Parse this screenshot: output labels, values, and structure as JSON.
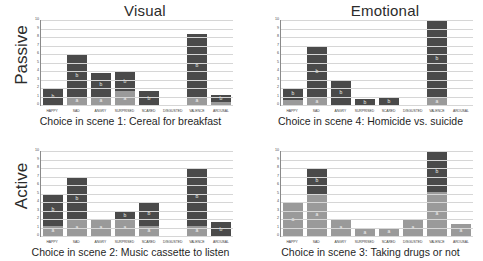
{
  "columns": [
    {
      "title": "Visual"
    },
    {
      "title": "Emotional"
    }
  ],
  "rows": [
    {
      "label": "Passive"
    },
    {
      "label": "Active"
    }
  ],
  "axis": {
    "ticks": [
      "0",
      "1",
      "2",
      "3",
      "4",
      "5",
      "6",
      "7",
      "8",
      "9",
      "10"
    ],
    "ymin": 0,
    "ymax": 10
  },
  "segment_labels": {
    "lower": "a",
    "upper": "b"
  },
  "colors": {
    "lower": "#9a9a9a",
    "upper": "#4a4a4a",
    "grid": "#d6d6d6",
    "axis": "#8a8a8a"
  },
  "chart_data": [
    {
      "type": "bar",
      "id": "panel-passive-visual",
      "title": "Visual",
      "row": "Passive",
      "caption": "Choice in scene 1: Cereal for breakfast",
      "xlabel": "",
      "ylabel": "",
      "ylim": [
        0,
        10
      ],
      "grid": true,
      "stacked": true,
      "categories": [
        "HAPPY",
        "SAD",
        "ANGRY",
        "SURPRISED",
        "SCARED",
        "DISGUSTED",
        "VALENCE",
        "AROUSAL"
      ],
      "series": [
        {
          "name": "a",
          "values": [
            0.0,
            1.0,
            1.0,
            1.6,
            0.0,
            0.0,
            1.0,
            0.4
          ]
        },
        {
          "name": "b",
          "values": [
            2.0,
            5.0,
            2.8,
            2.4,
            1.6,
            0.0,
            7.4,
            0.8
          ]
        }
      ],
      "totals": [
        2.0,
        6.0,
        3.8,
        4.0,
        1.6,
        0.0,
        8.4,
        1.2
      ]
    },
    {
      "type": "bar",
      "id": "panel-passive-emotional",
      "title": "Emotional",
      "row": "Passive",
      "caption": "Choice in scene 4: Homicide vs. suicide",
      "xlabel": "",
      "ylabel": "",
      "ylim": [
        0,
        10
      ],
      "grid": true,
      "stacked": true,
      "categories": [
        "HAPPY",
        "SAD",
        "ANGRY",
        "SURPRISED",
        "SCARED",
        "DISGUSTED",
        "VALENCE",
        "AROUSAL"
      ],
      "series": [
        {
          "name": "a",
          "values": [
            0.6,
            0.8,
            0.0,
            0.0,
            0.0,
            0.0,
            0.9,
            0.0
          ]
        },
        {
          "name": "b",
          "values": [
            1.4,
            6.2,
            3.0,
            0.7,
            0.8,
            0.0,
            9.1,
            0.0
          ]
        }
      ],
      "totals": [
        2.0,
        7.0,
        3.0,
        0.7,
        0.8,
        0.0,
        10.0,
        0.0
      ]
    },
    {
      "type": "bar",
      "id": "panel-active-visual",
      "title": "Visual",
      "row": "Active",
      "caption": "Choice in scene 2: Music cassette to listen",
      "xlabel": "",
      "ylabel": "",
      "ylim": [
        0,
        10
      ],
      "grid": true,
      "stacked": true,
      "categories": [
        "HAPPY",
        "SAD",
        "ANGRY",
        "SURPRISED",
        "SCARED",
        "DISGUSTED",
        "VALENCE",
        "AROUSAL"
      ],
      "series": [
        {
          "name": "a",
          "values": [
            1.2,
            2.0,
            2.0,
            2.0,
            1.2,
            0.0,
            1.2,
            0.0
          ]
        },
        {
          "name": "b",
          "values": [
            3.8,
            4.9,
            0.0,
            0.9,
            2.8,
            0.0,
            6.8,
            1.6
          ]
        }
      ],
      "totals": [
        5.0,
        6.9,
        2.0,
        2.9,
        4.0,
        0.0,
        8.0,
        1.6
      ]
    },
    {
      "type": "bar",
      "id": "panel-active-emotional",
      "title": "Emotional",
      "row": "Active",
      "caption": "Choice in scene 3: Taking drugs or not",
      "xlabel": "",
      "ylabel": "",
      "ylim": [
        0,
        10
      ],
      "grid": true,
      "stacked": true,
      "categories": [
        "HAPPY",
        "SAD",
        "ANGRY",
        "SURPRISED",
        "SCARED",
        "DISGUSTED",
        "VALENCE",
        "AROUSAL"
      ],
      "series": [
        {
          "name": "a",
          "values": [
            3.9,
            5.0,
            2.0,
            0.8,
            1.0,
            2.0,
            5.2,
            1.4
          ]
        },
        {
          "name": "b",
          "values": [
            0.0,
            3.0,
            0.0,
            0.0,
            0.0,
            0.0,
            4.8,
            0.0
          ]
        }
      ],
      "totals": [
        3.9,
        8.0,
        2.0,
        0.8,
        1.0,
        2.0,
        10.0,
        1.4
      ]
    }
  ]
}
